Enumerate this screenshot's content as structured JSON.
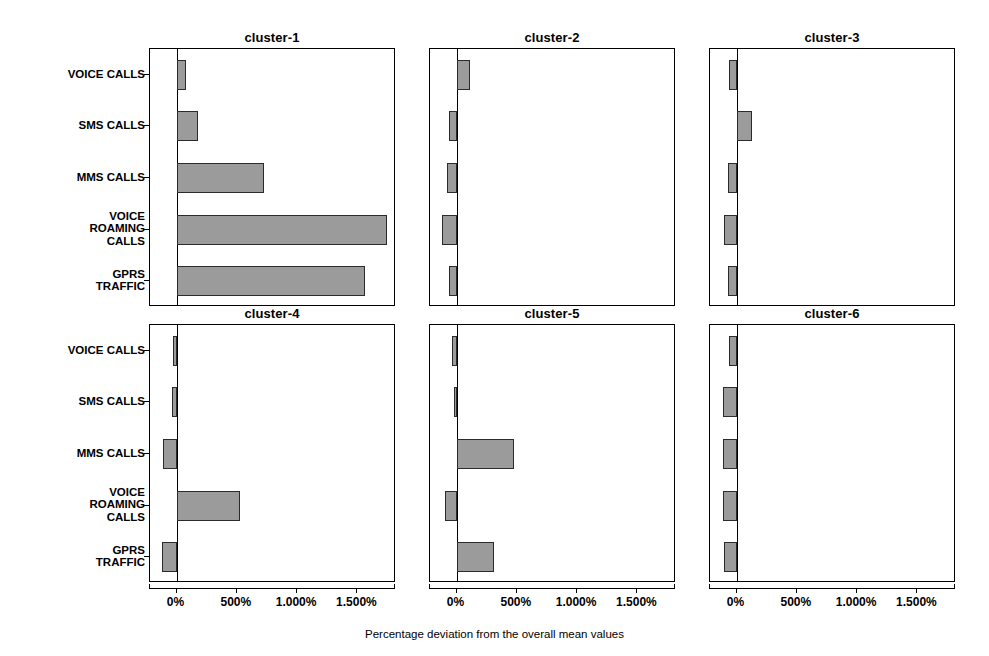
{
  "caption": "Percentage deviation from the overall mean values",
  "axis": {
    "tick_labels": [
      "0%",
      "500%",
      "1.000%",
      "1.500%"
    ],
    "tick_values": [
      0,
      500,
      1000,
      1500
    ],
    "xmin": -220,
    "xmax": 1820
  },
  "categories": [
    "VOICE CALLS",
    "SMS CALLS",
    "MMS CALLS",
    "VOICE\nROAMING\nCALLS",
    "GPRS\nTRAFFIC"
  ],
  "colors": {
    "bar_fill": "#9b9b9b",
    "bar_edge": "#2b2b2b",
    "axis": "#000000",
    "background": "#ffffff"
  },
  "chart_data": {
    "type": "bar",
    "orientation": "horizontal",
    "title": "",
    "xlabel": "Percentage deviation from the overall mean values",
    "ylabel": "",
    "xlim": [
      -220,
      1820
    ],
    "xticks": [
      0,
      500,
      1000,
      1500
    ],
    "xticklabels": [
      "0%",
      "500%",
      "1.000%",
      "1.500%"
    ],
    "grid": false,
    "legend": null,
    "categories": [
      "VOICE CALLS",
      "SMS CALLS",
      "MMS CALLS",
      "VOICE ROAMING CALLS",
      "GPRS TRAFFIC"
    ],
    "panels": [
      {
        "name": "cluster-1",
        "values": [
          75,
          180,
          725,
          1745,
          1565
        ]
      },
      {
        "name": "cluster-2",
        "values": [
          110,
          -60,
          -75,
          -120,
          -60
        ]
      },
      {
        "name": "cluster-3",
        "values": [
          -60,
          130,
          -70,
          -105,
          -70
        ]
      },
      {
        "name": "cluster-4",
        "values": [
          -30,
          -35,
          -110,
          530,
          -120
        ]
      },
      {
        "name": "cluster-5",
        "values": [
          -35,
          -20,
          480,
          -95,
          310
        ]
      },
      {
        "name": "cluster-6",
        "values": [
          -65,
          -110,
          -115,
          -110,
          -105
        ]
      }
    ]
  }
}
